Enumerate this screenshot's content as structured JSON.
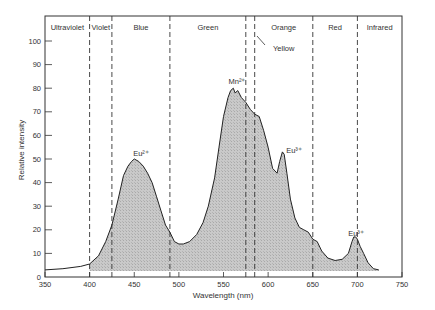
{
  "chart_data": {
    "type": "area",
    "title": "",
    "xlabel": "Wavelength (nm)",
    "ylabel": "Relative intensity",
    "xlim": [
      350,
      750
    ],
    "ylim": [
      0,
      105
    ],
    "x_ticks": [
      350,
      400,
      450,
      500,
      550,
      600,
      650,
      700,
      750
    ],
    "y_ticks": [
      0,
      10,
      20,
      30,
      40,
      50,
      60,
      70,
      80,
      90,
      100
    ],
    "grid": false,
    "legend": null,
    "regions": [
      {
        "label": "Ultraviolet",
        "from": 350,
        "to": 400
      },
      {
        "label": "Violet",
        "from": 400,
        "to": 425
      },
      {
        "label": "Blue",
        "from": 425,
        "to": 490
      },
      {
        "label": "Green",
        "from": 490,
        "to": 575
      },
      {
        "label": "Yellow",
        "from": 575,
        "to": 585
      },
      {
        "label": "Orange",
        "from": 585,
        "to": 650
      },
      {
        "label": "Red",
        "from": 650,
        "to": 700
      },
      {
        "label": "Infrared",
        "from": 700,
        "to": 750
      }
    ],
    "region_boundaries": [
      400,
      425,
      490,
      575,
      585,
      650,
      700
    ],
    "annotations": [
      {
        "text": "Eu²⁺",
        "x": 452,
        "y": 54
      },
      {
        "text": "Mn²⁺",
        "x": 559,
        "y": 83
      },
      {
        "text": "Eu³⁺",
        "x": 617,
        "y": 56
      },
      {
        "text": "Eu³⁺",
        "x": 695,
        "y": 21
      },
      {
        "text": "Yellow",
        "x": 590,
        "y": 99
      }
    ],
    "series": [
      {
        "name": "Emission spectrum",
        "x": [
          350,
          370,
          390,
          400,
          410,
          418,
          425,
          432,
          438,
          443,
          447,
          450,
          455,
          460,
          465,
          470,
          475,
          480,
          485,
          490,
          495,
          500,
          505,
          512,
          520,
          527,
          533,
          540,
          545,
          550,
          555,
          558,
          561,
          563,
          566,
          570,
          575,
          580,
          585,
          590,
          595,
          600,
          605,
          610,
          613,
          616,
          618,
          621,
          625,
          630,
          635,
          640,
          645,
          650,
          655,
          660,
          667,
          675,
          683,
          690,
          694,
          696,
          698,
          700,
          703,
          707,
          712,
          718,
          724
        ],
        "values": [
          3,
          3.5,
          4.5,
          5.5,
          9,
          15,
          22,
          33,
          43,
          47,
          49,
          50,
          49,
          47,
          44,
          40,
          34,
          28,
          22,
          19,
          15,
          14,
          14,
          15,
          18,
          23,
          30,
          42,
          55,
          68,
          76,
          79,
          80,
          78,
          79,
          76,
          74,
          71,
          69,
          68,
          62,
          55,
          46,
          44,
          49,
          53,
          52,
          44,
          33,
          25,
          21,
          20,
          19,
          16,
          15,
          11,
          8,
          7,
          7.5,
          10,
          15,
          17,
          17,
          16,
          13,
          10,
          6,
          3.5,
          3
        ]
      }
    ]
  },
  "labels": {
    "xlabel": "Wavelength (nm)",
    "ylabel": "Relative intensity",
    "eu2": "Eu²⁺",
    "mn2": "Mn²⁺",
    "eu3_orange": "Eu³⁺",
    "eu3_red": "Eu³⁺",
    "yellow": "Yellow"
  }
}
